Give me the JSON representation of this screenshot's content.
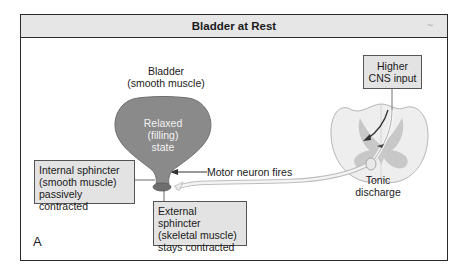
{
  "header": {
    "title": "Bladder at Rest",
    "corner_mark": "~"
  },
  "labels": {
    "bladder_line1": "Bladder",
    "bladder_line2": "(smooth muscle)",
    "state_line1": "Relaxed",
    "state_line2": "(filling)",
    "state_line3": "state",
    "motor_neuron": "Motor neuron fires",
    "tonic_line1": "Tonic",
    "tonic_line2": "discharge",
    "panel_letter": "A"
  },
  "boxes": {
    "internal_sphincter": {
      "line1": "Internal sphincter",
      "line2": "(smooth muscle)",
      "line3": "passively contracted"
    },
    "external_sphincter": {
      "line1": "External sphincter",
      "line2": "(skeletal muscle)",
      "line3": "stays contracted"
    },
    "higher_cns": {
      "line1": "Higher",
      "line2": "CNS input"
    }
  },
  "colors": {
    "bladder_fill": "#8a8a8a",
    "box_fill": "#e3e3e3",
    "header_fill": "#e6e6e6",
    "spinal_cord_fill": "#eeeeee",
    "gray_matter_fill": "#c8c8c8"
  }
}
